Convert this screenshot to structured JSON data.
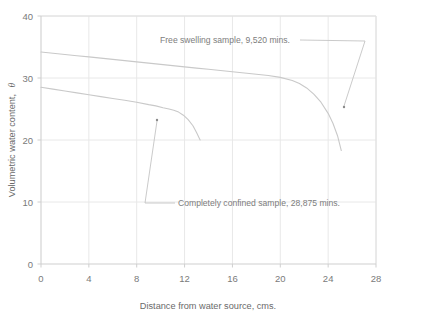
{
  "chart_data": {
    "type": "line",
    "title": "",
    "xlabel": "Distance from water source, cms.",
    "ylabel": "Volumetric water content,",
    "ylabel_symbol": "θ",
    "xlim": [
      0,
      28
    ],
    "ylim": [
      0,
      40
    ],
    "xticks": [
      0,
      4,
      8,
      12,
      16,
      20,
      24,
      28
    ],
    "yticks": [
      0,
      10,
      20,
      30,
      40
    ],
    "xticklabels": [
      "0",
      "4",
      "8",
      "12",
      "16",
      "20",
      "24",
      "28"
    ],
    "yticklabels": [
      "0",
      "10",
      "20",
      "30",
      "40"
    ],
    "grid": true,
    "grid_color": "#e8e8e8",
    "line_color": "#c9c9c9",
    "axis_color": "#d8d8d8",
    "legend": "none",
    "series": [
      {
        "name": "Free swelling sample",
        "label": "Free swelling sample,  9,520 mins.",
        "duration_mins": "9,520",
        "x": [
          0.0,
          1.0,
          2.0,
          3.0,
          4.0,
          5.0,
          6.0,
          7.0,
          8.0,
          9.0,
          10.0,
          11.0,
          12.0,
          13.0,
          14.0,
          15.0,
          16.0,
          17.0,
          18.0,
          19.0,
          20.0,
          21.0,
          21.6,
          22.2,
          22.8,
          23.4,
          24.0,
          24.4,
          24.8,
          25.1
        ],
        "y": [
          34.2,
          34.0,
          33.8,
          33.6,
          33.4,
          33.2,
          33.0,
          32.8,
          32.6,
          32.4,
          32.2,
          32.0,
          31.8,
          31.6,
          31.4,
          31.2,
          31.0,
          30.8,
          30.6,
          30.4,
          30.1,
          29.6,
          29.1,
          28.4,
          27.4,
          26.1,
          24.3,
          22.7,
          20.6,
          18.3
        ]
      },
      {
        "name": "Completely confined sample",
        "label": "Completely confined sample,  28,875 mins.",
        "duration_mins": "28,875",
        "x": [
          0.0,
          1.0,
          2.0,
          3.0,
          4.0,
          5.0,
          6.0,
          7.0,
          8.0,
          9.0,
          9.6,
          10.2,
          10.7,
          11.1,
          11.5,
          11.9,
          12.3,
          12.7,
          13.0,
          13.3
        ],
        "y": [
          28.5,
          28.2,
          27.9,
          27.6,
          27.3,
          27.0,
          26.7,
          26.4,
          26.1,
          25.7,
          25.5,
          25.2,
          25.0,
          24.8,
          24.5,
          24.0,
          23.3,
          22.3,
          21.2,
          20.0
        ]
      }
    ],
    "annotations": [
      {
        "name": "free-swelling-annotation",
        "text": "Free swelling sample,  9,520 mins.",
        "text_x": 160,
        "text_y": 43,
        "leader": "M 300,40 L 365,41 L 344,106",
        "marker_x": 344,
        "marker_y": 107
      },
      {
        "name": "confined-annotation",
        "text": "Completely confined sample,  28,875 mins.",
        "text_x": 178,
        "text_y": 206,
        "leader": "M 175,203 L 145,203 L 157,121",
        "marker_x": 157,
        "marker_y": 120
      }
    ]
  },
  "figure": {
    "background_color": "#ffffff",
    "plot_left": 41,
    "plot_right": 376,
    "plot_top": 16,
    "plot_bottom": 264
  }
}
